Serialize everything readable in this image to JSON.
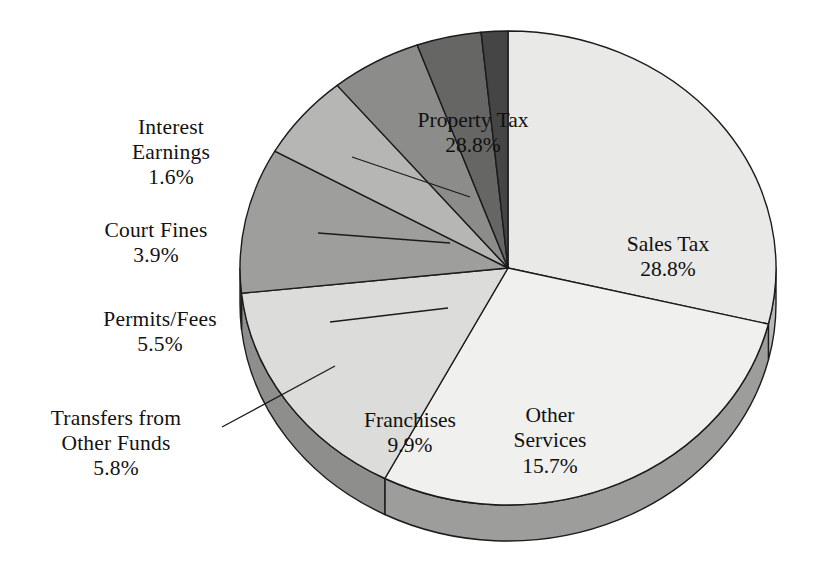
{
  "chart_data": {
    "type": "pie",
    "title": "",
    "subtitle": "",
    "xlabel": "",
    "ylabel": "",
    "legend_position": "none",
    "grid": false,
    "value_unit": "percent",
    "categories": [
      "Property Tax",
      "Sales Tax",
      "Other Services",
      "Franchises",
      "Transfers from Other Funds",
      "Permits/Fees",
      "Court Fines",
      "Interest Earnings"
    ],
    "values": [
      28.8,
      28.8,
      15.7,
      9.9,
      5.8,
      5.5,
      3.9,
      1.6
    ],
    "slices": [
      {
        "label": "Property Tax",
        "label_line1": "Property Tax",
        "label_line2": "",
        "value": 28.8,
        "value_text": "28.8%",
        "color": "#e9e9e7",
        "side_color": "#b9b9b7",
        "label_placement": "inside"
      },
      {
        "label": "Sales Tax",
        "label_line1": "Sales Tax",
        "label_line2": "",
        "value": 28.8,
        "value_text": "28.8%",
        "color": "#f0f0ee",
        "side_color": "#9d9d9b",
        "label_placement": "inside"
      },
      {
        "label": "Other Services",
        "label_line1": "Other",
        "label_line2": "Services",
        "value": 15.7,
        "value_text": "15.7%",
        "color": "#dcdcda",
        "side_color": "#8e8e8c",
        "label_placement": "inside"
      },
      {
        "label": "Franchises",
        "label_line1": "Franchises",
        "label_line2": "",
        "value": 9.9,
        "value_text": "9.9%",
        "color": "#9e9e9c",
        "side_color": "#8a8a88",
        "label_placement": "inside"
      },
      {
        "label": "Transfers from Other Funds",
        "label_line1": "Transfers from",
        "label_line2": "Other Funds",
        "value": 5.8,
        "value_text": "5.8%",
        "color": "#b6b6b4",
        "side_color": "#9a9a98",
        "label_placement": "outside"
      },
      {
        "label": "Permits/Fees",
        "label_line1": "Permits/Fees",
        "label_line2": "",
        "value": 5.5,
        "value_text": "5.5%",
        "color": "#8c8c8a",
        "side_color": "#7c7c7a",
        "label_placement": "outside"
      },
      {
        "label": "Court Fines",
        "label_line1": "Court Fines",
        "label_line2": "",
        "value": 3.9,
        "value_text": "3.9%",
        "color": "#666664",
        "side_color": "#59595a",
        "label_placement": "outside"
      },
      {
        "label": "Interest Earnings",
        "label_line1": "Interest",
        "label_line2": "Earnings",
        "value": 1.6,
        "value_text": "1.6%",
        "color": "#454545",
        "side_color": "#3c3c3c",
        "label_placement": "outside"
      }
    ]
  },
  "labels": {
    "interest_earnings": {
      "line1": "Interest",
      "line2": "Earnings",
      "value": "1.6%"
    },
    "court_fines": {
      "line1": "Court Fines",
      "line2": "",
      "value": "3.9%"
    },
    "permits_fees": {
      "line1": "Permits/Fees",
      "line2": "",
      "value": "5.5%"
    },
    "transfers": {
      "line1": "Transfers from",
      "line2": "Other Funds",
      "value": "5.8%"
    },
    "property_tax": {
      "line1": "Property Tax",
      "value": "28.8%"
    },
    "sales_tax": {
      "line1": "Sales Tax",
      "value": "28.8%"
    },
    "other_services": {
      "line1": "Other",
      "line2": "Services",
      "value": "15.7%"
    },
    "franchises": {
      "line1": "Franchises",
      "value": "9.9%"
    }
  },
  "geometry": {
    "center_x": 508,
    "center_y": 268,
    "radius_x": 268,
    "radius_y": 237,
    "depth": 36,
    "start_angle_deg": 0
  },
  "colors": {
    "background": "#ffffff",
    "outline": "#1b1b1b",
    "text": "#121212",
    "leader_line": "#1b1b1b"
  }
}
